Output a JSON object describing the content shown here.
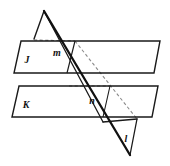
{
  "figure": {
    "width": 170,
    "height": 166,
    "background_color": "#ffffff",
    "stroke_color": "#1a1a1a",
    "dashed_color": "#6b6b6b"
  },
  "labels": {
    "plane_j": "J",
    "plane_k": "K",
    "line_m": "m",
    "line_n": "n",
    "line_l": "l"
  },
  "label_positions": {
    "plane_j": {
      "x": 27,
      "y": 63
    },
    "plane_k": {
      "x": 26,
      "y": 108
    },
    "line_m": {
      "x": 57,
      "y": 56
    },
    "line_n": {
      "x": 92,
      "y": 104
    },
    "line_l": {
      "x": 126,
      "y": 142
    }
  },
  "shapes": {
    "plane_j": {
      "name": "plane-j",
      "points": "21,41 160,41 154,73 14,73",
      "solid": true
    },
    "plane_k": {
      "name": "plane-k",
      "points": "19,86 158,86 152,117 12,117",
      "solid": true
    },
    "cutting_plane": {
      "name": "cutting-plane",
      "points": "44,11 34,39 103,122 137,119",
      "solid": false
    }
  },
  "segments": {
    "transversal_thick": {
      "x1": 44,
      "y1": 11,
      "x2": 130,
      "y2": 155
    },
    "cut_right_edge_upper": {
      "x1": 44,
      "y1": 11,
      "x2": 103,
      "y2": 122
    },
    "cut_left_edge": {
      "x1": 44,
      "y1": 11,
      "x2": 34,
      "y2": 39
    },
    "cut_bottom_edge": {
      "x1": 103,
      "y1": 122,
      "x2": 137,
      "y2": 119
    },
    "cut_right_lower": {
      "x1": 137,
      "y1": 119,
      "x2": 130,
      "y2": 155
    },
    "line_m_visible": {
      "x1": 75,
      "y1": 41,
      "x2": 67,
      "y2": 73
    },
    "line_n_visible": {
      "x1": 110,
      "y1": 86,
      "x2": 103,
      "y2": 117
    },
    "dashed_m": {
      "x1": 34,
      "y1": 40,
      "x2": 75,
      "y2": 41
    },
    "dashed_n": {
      "x1": 69,
      "y1": 86,
      "x2": 110,
      "y2": 86
    },
    "dashed_long": {
      "x1": 75,
      "y1": 41,
      "x2": 137,
      "y2": 119
    }
  },
  "description": {
    "plane_count": 3,
    "parallel_planes": [
      "J",
      "K"
    ],
    "intersection_lines": [
      "m",
      "n",
      "l"
    ]
  }
}
